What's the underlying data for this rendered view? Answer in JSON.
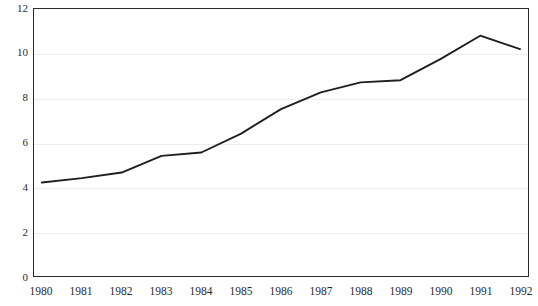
{
  "chart_data": {
    "type": "line",
    "title": "",
    "xlabel": "",
    "ylabel": "",
    "categories": [
      "1980",
      "1981",
      "1982",
      "1983",
      "1984",
      "1985",
      "1986",
      "1987",
      "1988",
      "1989",
      "1990",
      "1991",
      "1992"
    ],
    "values": [
      4.2,
      4.4,
      4.65,
      5.4,
      5.55,
      6.4,
      7.5,
      8.25,
      8.7,
      8.8,
      9.75,
      10.8,
      10.2
    ],
    "series": [
      {
        "name": "series-1",
        "values": [
          4.2,
          4.4,
          4.65,
          5.4,
          5.55,
          6.4,
          7.5,
          8.25,
          8.7,
          8.8,
          9.75,
          10.8,
          10.2
        ]
      }
    ],
    "ylim": [
      0,
      12
    ],
    "yticks": [
      0,
      2,
      4,
      6,
      8,
      10,
      12
    ],
    "ytick_labels": [
      "0",
      "2",
      "4",
      "6",
      "8",
      "10",
      "12"
    ],
    "xtick_labels": [
      "1980",
      "1981",
      "1982",
      "1983",
      "1984",
      "1985",
      "1986",
      "1987",
      "1988",
      "1989",
      "1990",
      "1991",
      "1992"
    ],
    "grid": true,
    "grid_axis": "y",
    "legend": false,
    "legend_position": "none",
    "line_color": "#1f1f1f",
    "grid_color": "#ededed",
    "frame_color": "#2b2b2b",
    "background_color": "#ffffff"
  }
}
